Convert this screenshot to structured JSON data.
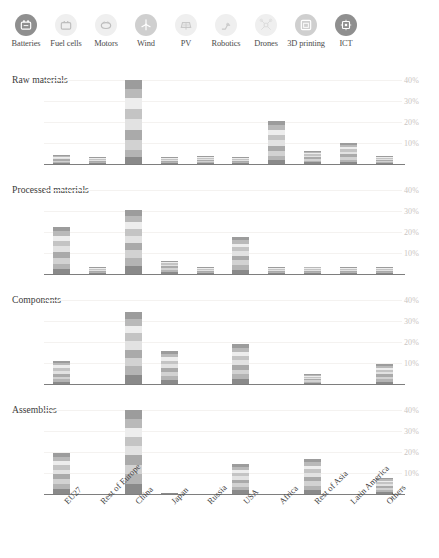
{
  "technology_legend": {
    "items": [
      {
        "label": "Batteries",
        "icon": "battery-icon",
        "tone": "dark"
      },
      {
        "label": "Fuel cells",
        "icon": "fuel-cell-icon",
        "tone": "pale"
      },
      {
        "label": "Motors",
        "icon": "electric-motor-icon",
        "tone": "pale"
      },
      {
        "label": "Wind",
        "icon": "wind-turbine-icon",
        "tone": "mid"
      },
      {
        "label": "PV",
        "icon": "solar-panel-icon",
        "tone": "pale"
      },
      {
        "label": "Robotics",
        "icon": "robot-arm-icon",
        "tone": "pale"
      },
      {
        "label": "Drones",
        "icon": "drone-icon",
        "tone": "pale"
      },
      {
        "label": "3D printing",
        "icon": "3d-printer-icon",
        "tone": "mid"
      },
      {
        "label": "ICT",
        "icon": "chip-icon",
        "tone": "dark"
      }
    ]
  },
  "chart_data": {
    "type": "bar",
    "stacked": true,
    "title": "",
    "xlabel": "",
    "ylabel": "",
    "ylim": [
      0,
      44
    ],
    "ytick_labels": [
      "10%",
      "20%",
      "30%",
      "40%"
    ],
    "ytick_values": [
      10,
      20,
      30,
      40
    ],
    "grid": true,
    "legend_position": "top",
    "categories": [
      "EU27",
      "Rest of Europe",
      "China",
      "Japan",
      "Russia",
      "USA",
      "Africa",
      "Rest of Asia",
      "Latin America",
      "Others"
    ],
    "series": [
      {
        "name": "Batteries",
        "color": "#8a8a8a"
      },
      {
        "name": "Fuel cells",
        "color": "#b4b4b4"
      },
      {
        "name": "Motors",
        "color": "#d2d2d2"
      },
      {
        "name": "Wind",
        "color": "#aaaaaa"
      },
      {
        "name": "PV",
        "color": "#e2e2e2"
      },
      {
        "name": "Robotics",
        "color": "#c4c4c4"
      },
      {
        "name": "Drones",
        "color": "#ededed"
      },
      {
        "name": "3D printing",
        "color": "#b9b9b9"
      },
      {
        "name": "ICT",
        "color": "#9c9c9c"
      }
    ],
    "panels": [
      {
        "title": "Raw materials",
        "values": {
          "EU27": [
            0.6,
            0.5,
            0.5,
            0.6,
            0.5,
            0.4,
            0.3,
            0.3,
            0.3
          ],
          "Rest of Europe": [
            0.4,
            0.3,
            0.3,
            0.3,
            0.3,
            0.2,
            0.2,
            0.2,
            0.2
          ],
          "China": [
            3.2,
            3.5,
            4.6,
            5.0,
            5.4,
            4.8,
            5.2,
            4.3,
            4.0
          ],
          "Japan": [
            0.2,
            0.2,
            0.1,
            0.1,
            0.1,
            0.1,
            0.1,
            0.1,
            0.1
          ],
          "Russia": [
            0.5,
            0.5,
            0.5,
            0.5,
            0.4,
            0.4,
            0.3,
            0.3,
            0.3
          ],
          "USA": [
            0.4,
            0.4,
            0.4,
            0.4,
            0.3,
            0.3,
            0.3,
            0.2,
            0.2
          ],
          "Africa": [
            1.8,
            1.9,
            2.3,
            2.6,
            2.8,
            2.6,
            2.4,
            2.2,
            2.1
          ],
          "Rest of Asia": [
            0.8,
            0.8,
            0.8,
            0.8,
            0.7,
            0.7,
            0.6,
            0.5,
            0.5
          ],
          "Latin America": [
            1.0,
            1.1,
            1.2,
            1.3,
            1.3,
            1.2,
            1.1,
            0.9,
            0.8
          ],
          "Others": [
            0.5,
            0.5,
            0.5,
            0.5,
            0.4,
            0.4,
            0.3,
            0.3,
            0.3
          ]
        }
      },
      {
        "title": "Processed materials",
        "values": {
          "EU27": [
            2.3,
            2.5,
            2.7,
            2.9,
            2.8,
            2.6,
            2.4,
            2.2,
            2.1
          ],
          "Rest of Europe": [
            0.1,
            0.1,
            0.1,
            0.1,
            0.1,
            0.1,
            0.1,
            0.1,
            0.1
          ],
          "China": [
            4.0,
            3.8,
            3.6,
            3.5,
            3.4,
            3.3,
            3.2,
            3.0,
            2.9
          ],
          "Japan": [
            1.1,
            1.0,
            0.9,
            0.8,
            0.7,
            0.6,
            0.5,
            0.4,
            0.3
          ],
          "Russia": [
            0.1,
            0.1,
            0.1,
            0.1,
            0.1,
            0.1,
            0.1,
            0.1,
            0.1
          ],
          "USA": [
            2.1,
            2.2,
            2.3,
            2.2,
            2.1,
            1.9,
            1.8,
            1.7,
            1.6
          ],
          "Africa": [
            0.1,
            0.1,
            0.1,
            0.1,
            0.1,
            0.1,
            0.1,
            0.1,
            0.1
          ],
          "Rest of Asia": [
            0.4,
            0.4,
            0.4,
            0.4,
            0.4,
            0.4,
            0.4,
            0.4,
            0.4
          ],
          "Latin America": [
            0.1,
            0.1,
            0.1,
            0.1,
            0.1,
            0.1,
            0.1,
            0.1,
            0.1
          ],
          "Others": [
            0.1,
            0.1,
            0.1,
            0.1,
            0.1,
            0.1,
            0.1,
            0.1,
            0.1
          ]
        }
      },
      {
        "title": "Components",
        "values": {
          "EU27": [
            1.1,
            1.2,
            1.3,
            1.4,
            1.4,
            1.3,
            1.2,
            1.1,
            1.0
          ],
          "Rest of Europe": [
            0.0,
            0.0,
            0.0,
            0.0,
            0.0,
            0.0,
            0.0,
            0.0,
            0.0
          ],
          "China": [
            4.2,
            4.2,
            4.1,
            4.0,
            3.9,
            3.8,
            3.6,
            3.5,
            3.4
          ],
          "Japan": [
            1.9,
            1.9,
            1.9,
            1.9,
            1.8,
            1.8,
            1.7,
            1.6,
            1.5
          ],
          "Russia": [
            0.0,
            0.0,
            0.0,
            0.0,
            0.0,
            0.0,
            0.0,
            0.0,
            0.0
          ],
          "USA": [
            2.3,
            2.3,
            2.3,
            2.3,
            2.2,
            2.1,
            2.0,
            1.9,
            1.8
          ],
          "Africa": [
            0.0,
            0.0,
            0.0,
            0.0,
            0.0,
            0.0,
            0.0,
            0.0,
            0.0
          ],
          "Rest of Asia": [
            0.6,
            0.6,
            0.6,
            0.6,
            0.5,
            0.5,
            0.5,
            0.4,
            0.4
          ],
          "Latin America": [
            0.0,
            0.0,
            0.0,
            0.0,
            0.0,
            0.0,
            0.0,
            0.0,
            0.0
          ],
          "Others": [
            1.2,
            1.2,
            1.2,
            1.1,
            1.1,
            1.0,
            1.0,
            0.9,
            0.9
          ]
        }
      },
      {
        "title": "Assemblies",
        "values": {
          "EU27": [
            2.4,
            2.4,
            2.4,
            2.3,
            2.2,
            2.1,
            2.0,
            1.9,
            1.8
          ],
          "Rest of Europe": [
            0.0,
            0.0,
            0.0,
            0.0,
            0.0,
            0.0,
            0.0,
            0.0,
            0.0
          ],
          "China": [
            4.7,
            4.7,
            4.6,
            4.6,
            4.5,
            4.4,
            4.3,
            4.2,
            4.1
          ],
          "Japan": [
            0.1,
            0.0,
            0.0,
            0.0,
            0.0,
            0.0,
            0.0,
            0.0,
            0.0
          ],
          "Russia": [
            0.0,
            0.0,
            0.0,
            0.0,
            0.0,
            0.0,
            0.0,
            0.0,
            0.0
          ],
          "USA": [
            1.7,
            1.7,
            1.7,
            1.7,
            1.6,
            1.6,
            1.5,
            1.5,
            1.4
          ],
          "Africa": [
            0.0,
            0.0,
            0.0,
            0.0,
            0.0,
            0.0,
            0.0,
            0.0,
            0.0
          ],
          "Rest of Asia": [
            2.0,
            2.0,
            2.0,
            2.0,
            1.9,
            1.9,
            1.8,
            1.7,
            1.7
          ],
          "Latin America": [
            0.0,
            0.0,
            0.0,
            0.0,
            0.0,
            0.0,
            0.0,
            0.0,
            0.0
          ],
          "Others": [
            1.0,
            1.0,
            1.0,
            0.9,
            0.9,
            0.8,
            0.8,
            0.7,
            0.7
          ]
        }
      }
    ]
  }
}
